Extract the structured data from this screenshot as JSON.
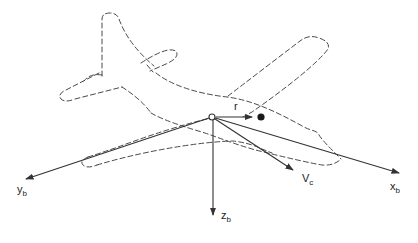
{
  "figure": {
    "type": "aircraft-body-axes-diagram",
    "background_color": "#ffffff",
    "axis_line_color": "#333333",
    "outline_color": "#4a4a4a"
  },
  "labels": {
    "y_axis": {
      "base": "y",
      "sub": "b"
    },
    "x_axis": {
      "base": "x",
      "sub": "b"
    },
    "z_axis": {
      "base": "z",
      "sub": "b"
    },
    "velocity": {
      "base": "V",
      "sub": "c"
    },
    "position_vector": {
      "base": "r",
      "sub": ""
    }
  }
}
